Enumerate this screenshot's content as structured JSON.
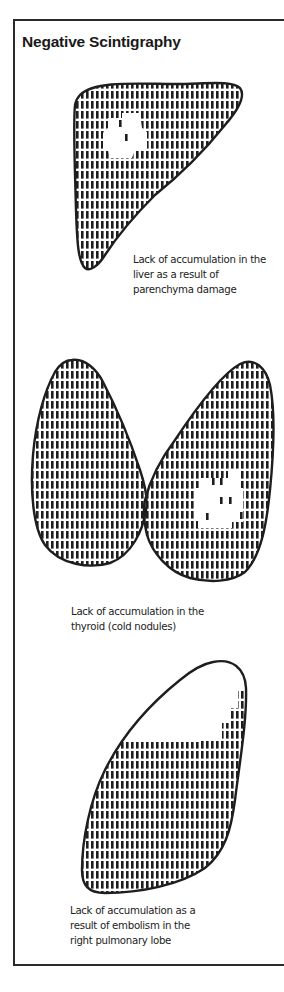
{
  "title": "Negative Scintigraphy",
  "colors": {
    "ink": "#1e1e1e",
    "paper": "#ffffff"
  },
  "panels": [
    {
      "organ": "liver",
      "caption_lines": [
        "Lack of accumulation in the",
        "liver as a result of",
        "parenchyma damage"
      ]
    },
    {
      "organ": "thyroid",
      "caption_lines": [
        "Lack of accumulation in the",
        "thyroid (cold nodules)"
      ]
    },
    {
      "organ": "lung",
      "caption_lines": [
        "Lack of accumulation as a",
        "result of embolism in the",
        "right pulmonary lobe"
      ]
    }
  ]
}
